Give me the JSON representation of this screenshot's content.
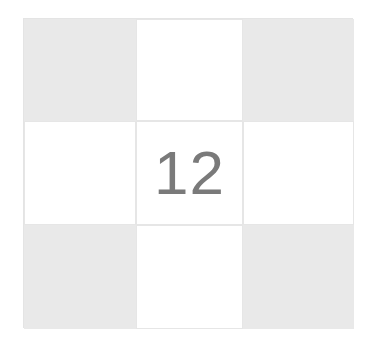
{
  "puzzle": {
    "rows": 3,
    "cols": 3,
    "colors": {
      "shaded": "#e9e9e9",
      "empty": "#ffffff",
      "text": "#7a7a7a",
      "grid_line": "#e6e6e6"
    },
    "cells": [
      {
        "row": 0,
        "col": 0,
        "shaded": true,
        "value": ""
      },
      {
        "row": 0,
        "col": 1,
        "shaded": false,
        "value": ""
      },
      {
        "row": 0,
        "col": 2,
        "shaded": true,
        "value": ""
      },
      {
        "row": 1,
        "col": 0,
        "shaded": false,
        "value": ""
      },
      {
        "row": 1,
        "col": 1,
        "shaded": false,
        "value": "12"
      },
      {
        "row": 1,
        "col": 2,
        "shaded": false,
        "value": ""
      },
      {
        "row": 2,
        "col": 0,
        "shaded": true,
        "value": ""
      },
      {
        "row": 2,
        "col": 1,
        "shaded": false,
        "value": ""
      },
      {
        "row": 2,
        "col": 2,
        "shaded": true,
        "value": ""
      }
    ]
  }
}
